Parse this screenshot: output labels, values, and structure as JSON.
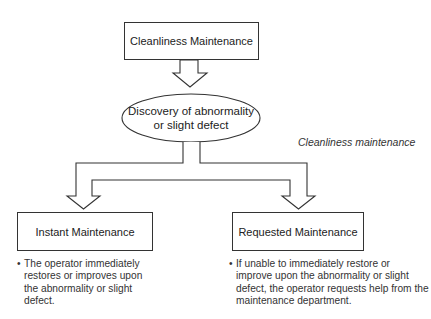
{
  "diagram": {
    "top_box": {
      "label": "Cleanliness Maintenance"
    },
    "ellipse": {
      "line1": "Discovery of abnormality",
      "line2": "or slight defect"
    },
    "side_note": "Cleanliness maintenance",
    "left_box": {
      "label": "Instant Maintenance",
      "bullet": "The operator immediately restores or improves upon the abnormality or slight defect."
    },
    "right_box": {
      "label": "Requested Maintenance",
      "bullet": "If unable to immediately restore or improve upon the abnormality or slight defect, the operator requests help from the maintenance department."
    },
    "bullet_symbol": "•",
    "colors": {
      "stroke": "#333333",
      "background": "#ffffff"
    }
  }
}
